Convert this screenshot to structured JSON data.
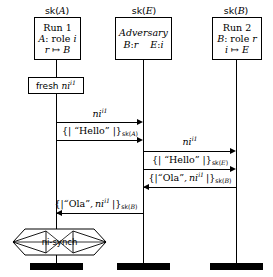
{
  "diagram": {
    "kind": "message-sequence-chart",
    "title": "",
    "background": "#ffffff",
    "ink": "#000000"
  },
  "lanes": [
    {
      "id": "lane-a",
      "key_label": "sk(A)",
      "key_base": "sk",
      "key_arg": "A",
      "box_lines": [
        "Run 1",
        "A: role i",
        "r ↦ B"
      ]
    },
    {
      "id": "lane-e",
      "key_label": "sk(E)",
      "key_base": "sk",
      "key_arg": "E",
      "box_lines": [
        "Adversary",
        "B:r    E:i"
      ]
    },
    {
      "id": "lane-b",
      "key_label": "sk(B)",
      "key_base": "sk",
      "key_arg": "B",
      "box_lines": [
        "Run 2",
        "B: role r",
        "i ↦ E"
      ]
    }
  ],
  "events": [
    {
      "id": "fresh-event",
      "lane": "lane-a",
      "label": "fresh ni",
      "label_sup": "i1",
      "full_text": "fresh ni^{i1}"
    }
  ],
  "messages": [
    {
      "id": "msg-1",
      "from": "lane-a",
      "to": "lane-e",
      "direction": "right",
      "label": "ni",
      "label_sup": "i1",
      "full_text": "ni^{i1}"
    },
    {
      "id": "msg-2",
      "from": "lane-a",
      "to": "lane-e",
      "direction": "right",
      "label": "{| “Hello” |}",
      "label_sub": "sk(A)",
      "full_text": "{| “Hello” |}_{sk(A)}"
    },
    {
      "id": "msg-3",
      "from": "lane-e",
      "to": "lane-b",
      "direction": "right",
      "label": "ni",
      "label_sup": "i1",
      "full_text": "ni^{i1}"
    },
    {
      "id": "msg-4",
      "from": "lane-e",
      "to": "lane-b",
      "direction": "right",
      "label": "{| “Hello” |}",
      "label_sub": "sk(E)",
      "full_text": "{| “Hello” |}_{sk(E)}"
    },
    {
      "id": "msg-5",
      "from": "lane-b",
      "to": "lane-e",
      "direction": "left",
      "label": "{| “Ola” , ni",
      "label_sup": "i1",
      "label_tail": " |}",
      "label_sub": "sk(B)",
      "full_text": "{| “Ola”, ni^{i1} |}_{sk(B)}"
    },
    {
      "id": "msg-6",
      "from": "lane-e",
      "to": "lane-a",
      "direction": "left",
      "label": "{| “Ola” , ni",
      "label_sup": "i1",
      "label_tail": " |}",
      "label_sub": "sk(B)",
      "full_text": "{| “Ola”, ni^{i1} |}_{sk(B)}"
    }
  ],
  "claim": {
    "id": "claim-ni-synch",
    "lane": "lane-a",
    "label": "ni-synch",
    "shape": "hexagon",
    "violated": true,
    "strike": "cross-out"
  },
  "terminators": [
    {
      "id": "term-a",
      "lane": "lane-a"
    },
    {
      "id": "term-e",
      "lane": "lane-e"
    },
    {
      "id": "term-b",
      "lane": "lane-b"
    }
  ]
}
